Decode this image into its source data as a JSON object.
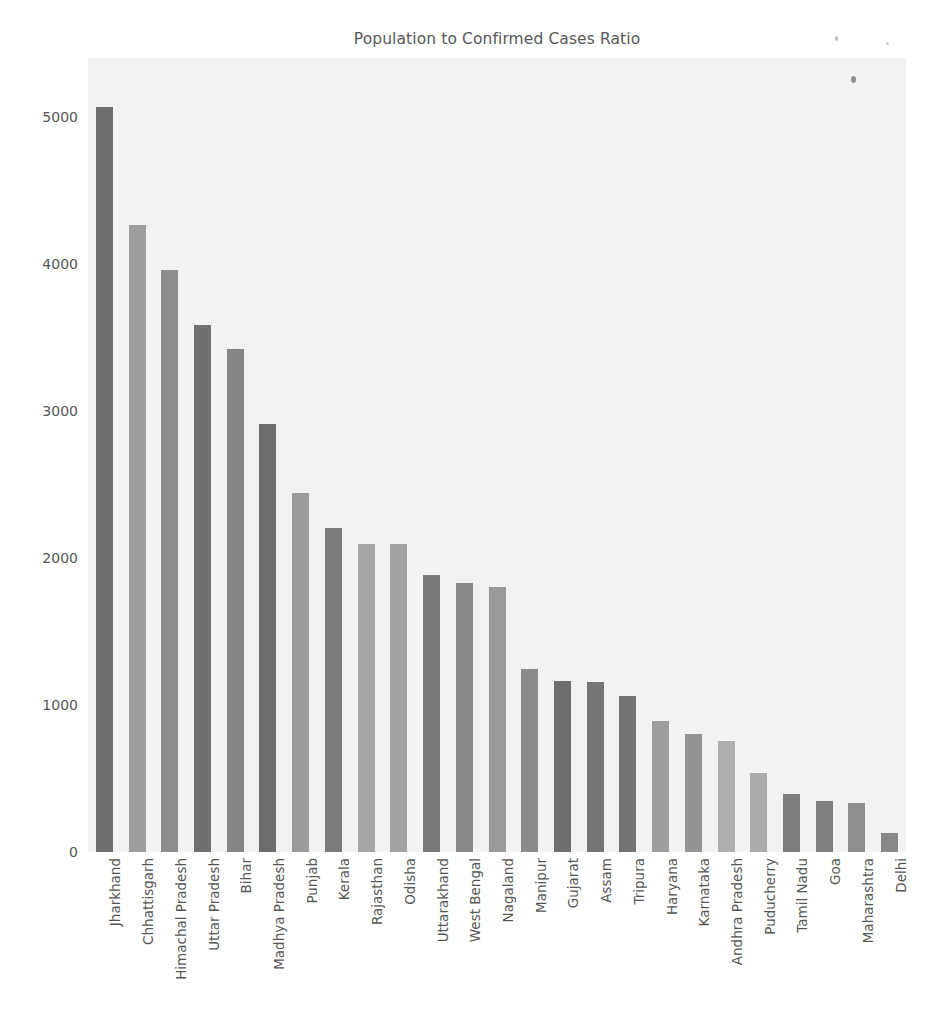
{
  "chart_data": {
    "type": "bar",
    "title": "Population to Confirmed Cases Ratio",
    "xlabel": "",
    "ylabel": "",
    "ylim": [
      0,
      5400
    ],
    "yticks": [
      0,
      1000,
      2000,
      3000,
      4000,
      5000
    ],
    "ytick_labels": [
      "0",
      "1000",
      "2000",
      "3000",
      "4000",
      "5000"
    ],
    "grid": false,
    "legend": "none",
    "categories": [
      "Jharkhand",
      "Chhattisgarh",
      "Himachal Pradesh",
      "Uttar Pradesh",
      "Bihar",
      "Madhya Pradesh",
      "Punjab",
      "Kerala",
      "Rajasthan",
      "Odisha",
      "Uttarakhand",
      "West Bengal",
      "Nagaland",
      "Manipur",
      "Gujarat",
      "Assam",
      "Tripura",
      "Haryana",
      "Karnataka",
      "Andhra Pradesh",
      "Puducherry",
      "Tamil Nadu",
      "Goa",
      "Maharashtra",
      "Delhi"
    ],
    "values": [
      5065,
      4265,
      3955,
      3585,
      3420,
      2910,
      2440,
      2205,
      2095,
      2095,
      1885,
      1830,
      1800,
      1245,
      1165,
      1155,
      1060,
      890,
      800,
      755,
      540,
      395,
      350,
      335,
      130
    ],
    "bar_colors": [
      "#6f6f6f",
      "#9e9e9e",
      "#8d8d8d",
      "#707070",
      "#858585",
      "#6c6c6c",
      "#9b9b9b",
      "#7b7b7b",
      "#a6a6a6",
      "#a2a2a2",
      "#7a7a7a",
      "#898989",
      "#9a9a9a",
      "#8b8b8b",
      "#6e6e6e",
      "#757575",
      "#737373",
      "#9d9d9d",
      "#949494",
      "#aeaeae",
      "#ababab",
      "#7e7e7e",
      "#7f7f7f",
      "#8e8e8e",
      "#888888"
    ],
    "plot_background": "#f2f2f2",
    "figure_background": "#ffffff",
    "tick_label_color": "#565656",
    "title_color": "#585858"
  }
}
